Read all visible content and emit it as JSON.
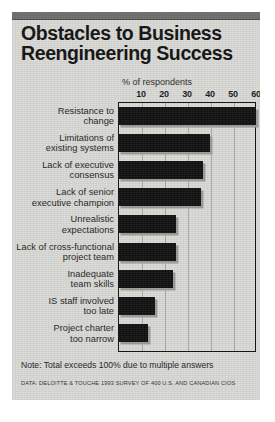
{
  "figure": {
    "title_line1": "Obstacles to Business",
    "title_line2": "Reengineering Success",
    "note": "Note: Total exceeds 100% due to multiple answers",
    "source": "DATA: DELOITTE & TOUCHE 1993 SURVEY OF 400 U.S. AND CANADIAN CIOS"
  },
  "chart_data": {
    "type": "bar",
    "orientation": "horizontal",
    "title": "Obstacles to Business Reengineering Success",
    "xlabel": "% of respondents",
    "ylabel": "",
    "xlim": [
      0,
      60
    ],
    "xticks": [
      10,
      20,
      30,
      40,
      50,
      60
    ],
    "grid": true,
    "legend": null,
    "bar_color": "#111111",
    "shadow_color": "#9b9b97",
    "background": "#d9d9d6",
    "categories": [
      "Resistance to change",
      "Limitations of existing systems",
      "Lack of executive consensus",
      "Lack of senior executive champion",
      "Unrealistic expectations",
      "Lack of cross-functional project team",
      "Inadequate team skills",
      "IS staff involved too late",
      "Project charter too narrow"
    ],
    "category_lines": [
      [
        "Resistance to",
        "change"
      ],
      [
        "Limitations of",
        "existing systems"
      ],
      [
        "Lack of executive",
        "consensus"
      ],
      [
        "Lack of senior",
        "executive champion"
      ],
      [
        "Unrealistic",
        "expectations"
      ],
      [
        "Lack of cross-functional",
        "project team"
      ],
      [
        "Inadequate",
        "team skills"
      ],
      [
        "IS staff involved",
        "too late"
      ],
      [
        "Project charter",
        "too narrow"
      ]
    ],
    "values": [
      60,
      40,
      37,
      36,
      25,
      25,
      24,
      16,
      13
    ],
    "note": "Note: Total exceeds 100% due to multiple answers",
    "source": "DATA: DELOITTE & TOUCHE 1993 SURVEY OF 400 U.S. AND CANADIAN CIOS"
  }
}
